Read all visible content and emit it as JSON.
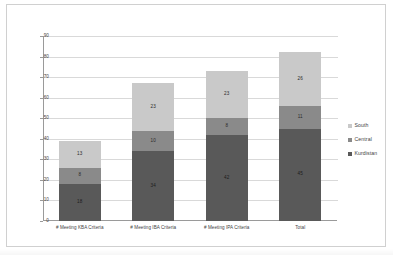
{
  "chart_data": {
    "type": "bar",
    "stacked": true,
    "title": "",
    "xlabel": "",
    "ylabel": "",
    "ylim": [
      0,
      90
    ],
    "ytick_step": 10,
    "yticks": [
      0,
      10,
      20,
      30,
      40,
      50,
      60,
      70,
      80,
      90
    ],
    "grid": true,
    "legend_position": "right",
    "categories": [
      "# Meeting KBA Criteria",
      "# Meeting IBA Criteria",
      "# Meeting IPA Criteria",
      "Total"
    ],
    "series": [
      {
        "name": "Kurdistan",
        "color": "#595959",
        "values": [
          18,
          34,
          42,
          45
        ]
      },
      {
        "name": "Central",
        "color": "#8a8a8a",
        "values": [
          8,
          10,
          8,
          11
        ]
      },
      {
        "name": "South",
        "color": "#c9c9c9",
        "values": [
          13,
          23,
          23,
          26
        ]
      }
    ],
    "stack_totals": [
      39,
      67,
      73,
      82
    ]
  },
  "axes": {
    "y_tick_labels": [
      "90",
      "80",
      "70",
      "60",
      "50",
      "40",
      "30",
      "20",
      "10",
      "0"
    ]
  },
  "legend": {
    "items": [
      {
        "label": "South",
        "color": "#c9c9c9"
      },
      {
        "label": "Central",
        "color": "#8a8a8a"
      },
      {
        "label": "Kurdistan",
        "color": "#595959"
      }
    ]
  }
}
